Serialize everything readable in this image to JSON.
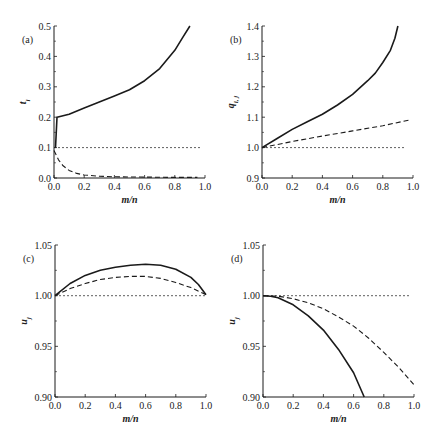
{
  "chart_data": [
    {
      "panel": "(a)",
      "type": "line",
      "xlabel": "m/n",
      "ylabel": "t_i",
      "xlim": [
        0.0,
        1.0
      ],
      "ylim": [
        0.0,
        0.5
      ],
      "xticks": [
        "0.0",
        "0.2",
        "0.4",
        "0.6",
        "0.8",
        "1.0"
      ],
      "yticks": [
        "0.0",
        "0.1",
        "0.2",
        "0.3",
        "0.4",
        "0.5"
      ],
      "grid": false,
      "series": [
        {
          "name": "solid",
          "style": "solid",
          "x": [
            0.01,
            0.01,
            0.02,
            0.1,
            0.2,
            0.3,
            0.4,
            0.5,
            0.6,
            0.7,
            0.8,
            0.85,
            0.9
          ],
          "y": [
            0.1,
            0.1,
            0.2,
            0.21,
            0.23,
            0.25,
            0.27,
            0.29,
            0.32,
            0.36,
            0.42,
            0.46,
            0.5
          ]
        },
        {
          "name": "dashed",
          "style": "dashed",
          "x": [
            0.0,
            0.03,
            0.06,
            0.1,
            0.15,
            0.2,
            0.3,
            0.4,
            0.6,
            0.8,
            0.95
          ],
          "y": [
            0.09,
            0.06,
            0.04,
            0.025,
            0.015,
            0.01,
            0.006,
            0.004,
            0.003,
            0.002,
            0.002
          ]
        },
        {
          "name": "reference",
          "style": "dotted",
          "x": [
            0.0,
            0.97
          ],
          "y": [
            0.1,
            0.1
          ]
        }
      ]
    },
    {
      "panel": "(b)",
      "type": "line",
      "xlabel": "m/n",
      "ylabel": "q_{i,j}",
      "xlim": [
        0.0,
        1.0
      ],
      "ylim": [
        0.9,
        1.4
      ],
      "xticks": [
        "0.0",
        "0.2",
        "0.4",
        "0.6",
        "0.8",
        "1.0"
      ],
      "yticks": [
        "0.9",
        "1.0",
        "1.1",
        "1.2",
        "1.3",
        "1.4"
      ],
      "grid": false,
      "series": [
        {
          "name": "solid",
          "style": "solid",
          "x": [
            0.0,
            0.1,
            0.2,
            0.3,
            0.4,
            0.5,
            0.6,
            0.7,
            0.75,
            0.8,
            0.85,
            0.88,
            0.9
          ],
          "y": [
            1.0,
            1.03,
            1.06,
            1.085,
            1.11,
            1.14,
            1.175,
            1.22,
            1.245,
            1.28,
            1.32,
            1.36,
            1.4
          ]
        },
        {
          "name": "dashed",
          "style": "dashed",
          "x": [
            0.0,
            0.2,
            0.4,
            0.6,
            0.8,
            0.97
          ],
          "y": [
            1.0,
            1.02,
            1.038,
            1.055,
            1.072,
            1.09
          ]
        },
        {
          "name": "reference",
          "style": "dotted",
          "x": [
            0.0,
            0.95
          ],
          "y": [
            1.0,
            1.0
          ]
        }
      ]
    },
    {
      "panel": "(c)",
      "type": "line",
      "xlabel": "m/n",
      "ylabel": "u_j",
      "xlim": [
        0.0,
        1.0
      ],
      "ylim": [
        0.9,
        1.05
      ],
      "xticks": [
        "0.0",
        "0.2",
        "0.4",
        "0.6",
        "0.8",
        "1.0"
      ],
      "yticks": [
        "0.90",
        "0.95",
        "1.00",
        "1.05"
      ],
      "grid": false,
      "series": [
        {
          "name": "solid",
          "style": "solid",
          "x": [
            0.0,
            0.1,
            0.2,
            0.3,
            0.4,
            0.5,
            0.6,
            0.7,
            0.8,
            0.9,
            0.95,
            1.0
          ],
          "y": [
            1.0,
            1.012,
            1.02,
            1.025,
            1.028,
            1.03,
            1.031,
            1.03,
            1.026,
            1.018,
            1.011,
            1.001
          ]
        },
        {
          "name": "dashed",
          "style": "dashed",
          "x": [
            0.0,
            0.1,
            0.2,
            0.3,
            0.4,
            0.5,
            0.6,
            0.7,
            0.8,
            0.9,
            1.0
          ],
          "y": [
            1.0,
            1.007,
            1.012,
            1.016,
            1.018,
            1.019,
            1.019,
            1.017,
            1.013,
            1.008,
            1.001
          ]
        },
        {
          "name": "reference",
          "style": "dotted",
          "x": [
            0.0,
            1.0
          ],
          "y": [
            1.0,
            1.0
          ]
        }
      ]
    },
    {
      "panel": "(d)",
      "type": "line",
      "xlabel": "m/n",
      "ylabel": "u_j",
      "xlim": [
        0.0,
        1.0
      ],
      "ylim": [
        0.9,
        1.05
      ],
      "xticks": [
        "0.0",
        "0.2",
        "0.4",
        "0.6",
        "0.8",
        "1.0"
      ],
      "yticks": [
        "0.90",
        "0.95",
        "1.00",
        "1.05"
      ],
      "grid": false,
      "series": [
        {
          "name": "solid",
          "style": "solid",
          "x": [
            0.0,
            0.05,
            0.1,
            0.2,
            0.3,
            0.4,
            0.5,
            0.6,
            0.67
          ],
          "y": [
            1.0,
            0.9995,
            0.998,
            0.991,
            0.98,
            0.966,
            0.947,
            0.924,
            0.9
          ]
        },
        {
          "name": "dashed",
          "style": "dashed",
          "x": [
            0.0,
            0.1,
            0.2,
            0.3,
            0.4,
            0.5,
            0.6,
            0.7,
            0.8,
            0.9,
            1.0
          ],
          "y": [
            1.0,
            0.9995,
            0.997,
            0.993,
            0.987,
            0.979,
            0.97,
            0.958,
            0.944,
            0.929,
            0.912
          ]
        },
        {
          "name": "reference",
          "style": "dotted",
          "x": [
            0.0,
            0.97
          ],
          "y": [
            1.0,
            1.0
          ]
        }
      ]
    }
  ],
  "panels": [
    {
      "label": "(a)",
      "ylabel": "t",
      "ylabel_sub": "i",
      "xlabel": "m/n"
    },
    {
      "label": "(b)",
      "ylabel": "q",
      "ylabel_sub": "i, j",
      "xlabel": "m/n"
    },
    {
      "label": "(c)",
      "ylabel": "u",
      "ylabel_sub": "j",
      "xlabel": "m/n"
    },
    {
      "label": "(d)",
      "ylabel": "u",
      "ylabel_sub": "j",
      "xlabel": "m/n"
    }
  ]
}
